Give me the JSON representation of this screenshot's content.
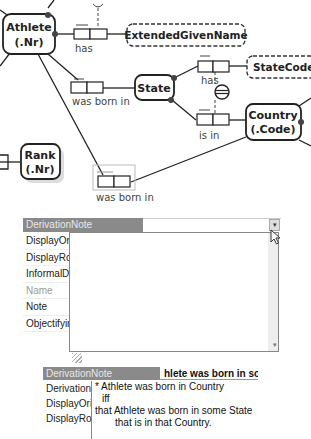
{
  "diagram": {
    "entities": [
      {
        "id": "athlete",
        "name": "Athlete",
        "refmode": "(.Nr)"
      },
      {
        "id": "state",
        "name": "State",
        "refmode": ""
      },
      {
        "id": "country",
        "name": "Country",
        "refmode": "(.Code)"
      },
      {
        "id": "rank",
        "name": "Rank",
        "refmode": "(.Nr)"
      }
    ],
    "value_types": [
      {
        "id": "extended-given-name",
        "name": "ExtendedGivenName"
      },
      {
        "id": "state-code",
        "name": "StateCode"
      }
    ],
    "fact_types": [
      {
        "id": "athlete-has-extendedgivenname",
        "reading": "has"
      },
      {
        "id": "athlete-was-born-in-state",
        "reading": "was born in"
      },
      {
        "id": "state-has-statecode",
        "reading": "has"
      },
      {
        "id": "state-is-in-country",
        "reading": "is in"
      },
      {
        "id": "athlete-was-born-in-country",
        "reading": "was born in",
        "derived": true
      }
    ],
    "constraints": [
      {
        "id": "external-uniqueness",
        "symbol": "⊖"
      }
    ]
  },
  "properties_dropdown": {
    "selected_property": "DerivationNote",
    "dropdown_symbol": "▾",
    "scroll_down_symbol": "▾",
    "properties": [
      {
        "label": "DisplayOrie",
        "dim": false
      },
      {
        "label": "DisplayRol",
        "dim": false
      },
      {
        "label": "InformalDe",
        "dim": false
      },
      {
        "label": "Name",
        "dim": true
      },
      {
        "label": "Note",
        "dim": false
      },
      {
        "label": "Objectifyin",
        "dim": false
      }
    ]
  },
  "properties_note": {
    "selected_property": "DerivationNote",
    "value_preview": "hlete was born in sor",
    "properties": [
      {
        "label": "DerivationS"
      },
      {
        "label": "DisplayOrie"
      },
      {
        "label": "DisplayRol"
      }
    ],
    "note_lines": [
      "* Athlete was born in Country",
      "iff",
      "that Athlete was born in some State",
      "that is in that Country."
    ]
  }
}
